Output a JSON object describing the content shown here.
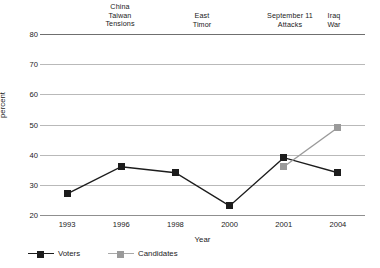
{
  "chart_data": {
    "type": "line",
    "title": "",
    "xlabel": "Year",
    "ylabel": "percent",
    "categories": [
      "1993",
      "1996",
      "1998",
      "2000",
      "2001",
      "2004"
    ],
    "ylim": [
      20,
      80
    ],
    "yticks": [
      20,
      30,
      40,
      50,
      60,
      70,
      80
    ],
    "grid": true,
    "legend_position": "bottom-left",
    "series": [
      {
        "name": "Voters",
        "color": "#1c1c1c",
        "marker": "square",
        "values": [
          27,
          36,
          34,
          23,
          39,
          34
        ]
      },
      {
        "name": "Candidates",
        "color": "#9a9a9a",
        "marker": "square",
        "values": [
          null,
          null,
          null,
          null,
          36,
          49
        ]
      }
    ],
    "annotations": [
      {
        "text": "China\nTaiwan\nTensions",
        "x_px": 120,
        "y_px": 3
      },
      {
        "text": "East\nTimor",
        "x_px": 202,
        "y_px": 12
      },
      {
        "text": "September 11\nAttacks",
        "x_px": 290,
        "y_px": 12
      },
      {
        "text": "Iraq\nWar",
        "x_px": 334,
        "y_px": 12
      }
    ]
  }
}
